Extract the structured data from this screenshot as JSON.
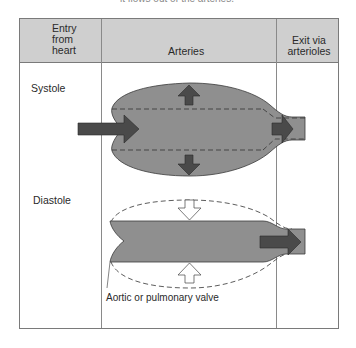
{
  "figure": {
    "cutoff_caption": "it flows out of the arteries."
  },
  "table": {
    "headers": {
      "entry": "Entry\nfrom\nheart",
      "entry_lines": [
        "Entry",
        "from",
        "heart"
      ],
      "arteries": "Arteries",
      "exit_lines": [
        "Exit via",
        "arterioles"
      ]
    },
    "rows": [
      {
        "label": "Systole",
        "description": "Arteries distend; blood enters from heart and exits via arterioles"
      },
      {
        "label": "Diastole",
        "description": "Arteries recoil inward; blood continues to exit via arterioles"
      }
    ],
    "annotation": "Aortic or pulmonary valve"
  },
  "colors": {
    "header_bg": "#cfcfcf",
    "vessel_fill": "#8f8f8f",
    "arrow_fill": "#4a4a4a",
    "border": "#7a7a7a"
  },
  "icons": {
    "systole_inflow": "arrow-right-icon",
    "systole_expand_up": "arrow-up-icon",
    "systole_expand_down": "arrow-down-icon",
    "systole_outflow": "arrow-right-icon",
    "diastole_recoil_down": "hollow-arrow-down-icon",
    "diastole_recoil_up": "hollow-arrow-up-icon",
    "diastole_outflow": "arrow-right-icon"
  }
}
